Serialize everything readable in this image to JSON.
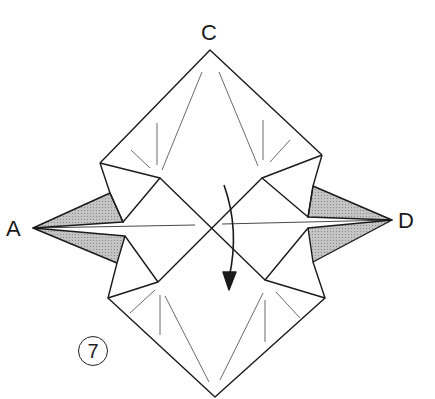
{
  "diagram": {
    "type": "origami-folding-step",
    "labels": {
      "top": "C",
      "left": "A",
      "right": "D"
    },
    "step_number": "7",
    "colors": {
      "line": "#1a1a1a",
      "shade": "#b8b8b8",
      "background": "#ffffff"
    },
    "arrow": {
      "kind": "valley-fold-arrow",
      "direction": "down"
    }
  }
}
